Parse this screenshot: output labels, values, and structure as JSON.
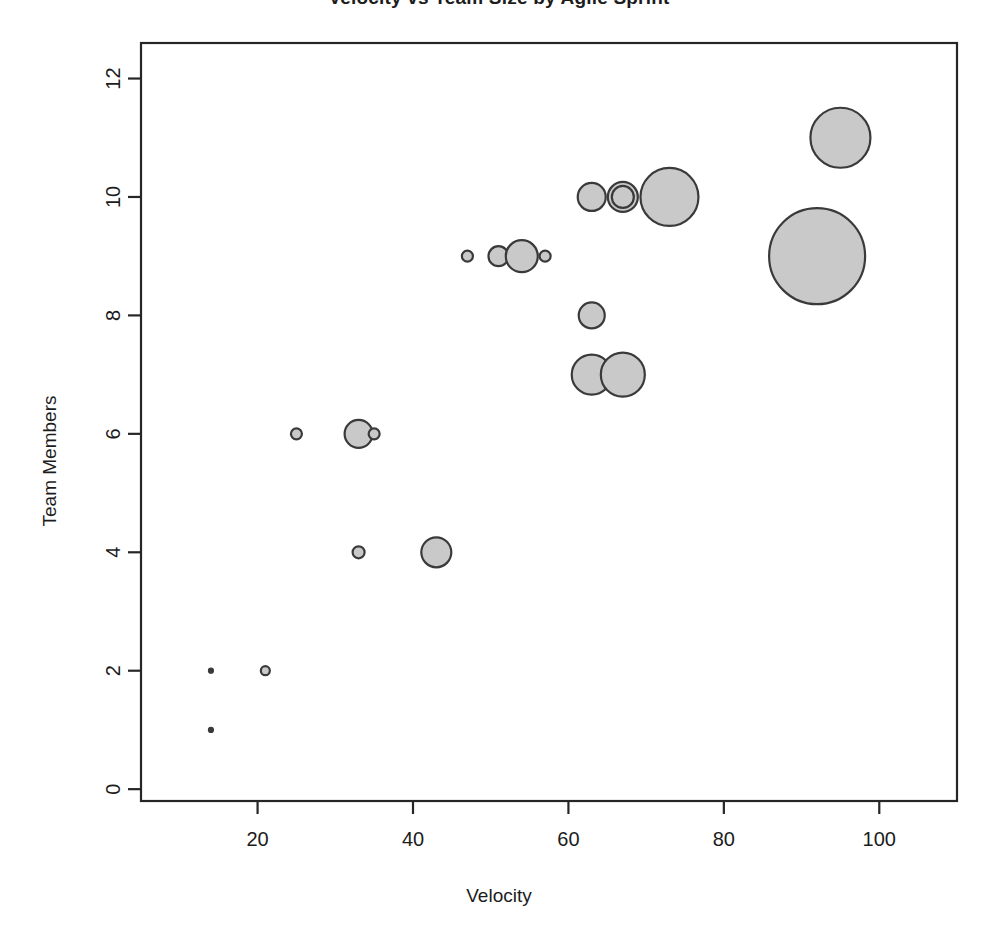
{
  "chart_data": {
    "type": "scatter",
    "variant": "bubble",
    "title": "Velocity vs Team Size by Agile Sprint",
    "xlabel": "Velocity",
    "ylabel": "Team Members",
    "xlim": [
      5,
      110
    ],
    "ylim": [
      -0.2,
      12.6
    ],
    "xticks": [
      20,
      40,
      60,
      80,
      100
    ],
    "yticks": [
      0,
      2,
      4,
      6,
      8,
      10,
      12
    ],
    "grid": false,
    "legend": "none",
    "point_fill": "#c9c9c9",
    "point_stroke": "#3a3a3a",
    "background": "#ffffff",
    "size_meaning": "bubble area scales with a third variable",
    "points": [
      {
        "x": 14,
        "y": 1,
        "r": 2.5
      },
      {
        "x": 14,
        "y": 2,
        "r": 2.5
      },
      {
        "x": 21,
        "y": 2,
        "r": 4.5
      },
      {
        "x": 25,
        "y": 6,
        "r": 5.5
      },
      {
        "x": 33,
        "y": 6,
        "r": 14
      },
      {
        "x": 35,
        "y": 6,
        "r": 5.5
      },
      {
        "x": 33,
        "y": 4,
        "r": 6
      },
      {
        "x": 43,
        "y": 4,
        "r": 15
      },
      {
        "x": 47,
        "y": 9,
        "r": 5.5
      },
      {
        "x": 51,
        "y": 9,
        "r": 10
      },
      {
        "x": 54,
        "y": 9,
        "r": 16
      },
      {
        "x": 57,
        "y": 9,
        "r": 5.5
      },
      {
        "x": 63,
        "y": 10,
        "r": 14
      },
      {
        "x": 67,
        "y": 10,
        "r": 15
      },
      {
        "x": 67,
        "y": 10,
        "r": 11
      },
      {
        "x": 73,
        "y": 10,
        "r": 29
      },
      {
        "x": 63,
        "y": 8,
        "r": 13
      },
      {
        "x": 63,
        "y": 7,
        "r": 20
      },
      {
        "x": 67,
        "y": 7,
        "r": 22
      },
      {
        "x": 95,
        "y": 11,
        "r": 30
      },
      {
        "x": 92,
        "y": 9,
        "r": 48
      }
    ]
  },
  "axes": {
    "x_tick_labels": [
      "20",
      "40",
      "60",
      "80",
      "100"
    ],
    "y_tick_labels": [
      "0",
      "2",
      "4",
      "6",
      "8",
      "10",
      "12"
    ]
  }
}
